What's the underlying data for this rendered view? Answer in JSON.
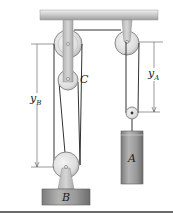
{
  "figure": {
    "labels": {
      "pulley_c": "C",
      "block_a": "A",
      "block_b": "B",
      "dim_a_main": "y",
      "dim_a_sub": "A",
      "dim_b_main": "y",
      "dim_b_sub": "B"
    },
    "colors": {
      "ceiling_light": "#e2e2e2",
      "ceiling_dark": "#9a9a9a",
      "pulley_face": "#e6e6e6",
      "pulley_rim": "#8a8a8a",
      "bracket": "#c8c8c8",
      "block": "#9c9c9c",
      "block_dark": "#6f6f6f",
      "cable": "#333333",
      "dimension": "#555555",
      "rule": "#3a3a3a"
    },
    "components": [
      "ceiling",
      "fixed-pulley-left",
      "pulley-C",
      "fixed-pulley-right",
      "pulley-A",
      "block-A",
      "pulley-B",
      "block-B",
      "dimension-yA",
      "dimension-yB"
    ]
  }
}
